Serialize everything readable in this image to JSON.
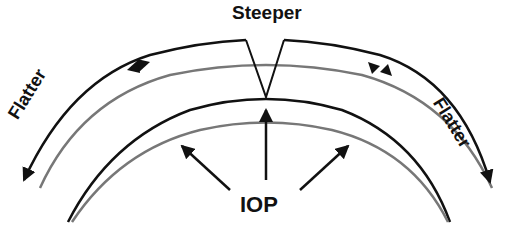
{
  "diagram": {
    "labels": {
      "top": "Steeper",
      "center": "IOP",
      "left": "Flatter",
      "right": "Flatter"
    },
    "colors": {
      "line_black": "#111111",
      "line_gray": "#777777",
      "background": "#ffffff"
    },
    "elements": {
      "outer_black_arc": "deformed outer surface with central V notch",
      "outer_gray_arc": "original outer surface",
      "inner_black_arc": "deformed inner surface",
      "inner_gray_arc": "original inner surface",
      "iop_arrows": 3,
      "flatter_arrows": 2,
      "mid_arc_markers": 2
    }
  }
}
